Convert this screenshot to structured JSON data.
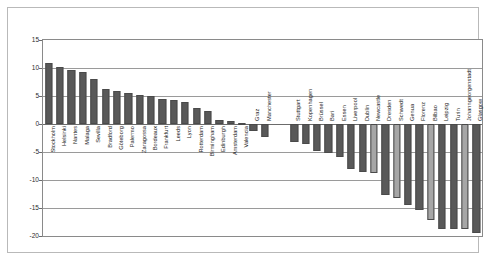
{
  "chart_data": {
    "type": "bar",
    "title": "",
    "subtitle": "",
    "xlabel": "",
    "ylabel": "",
    "ylim": [
      -20,
      15
    ],
    "yticks": [
      15,
      10,
      5,
      0,
      -5,
      -10,
      -15,
      -20
    ],
    "ytick_labels": [
      "15",
      "10",
      "5",
      "0",
      "-5",
      "-10",
      "-15",
      "-20"
    ],
    "grid": true,
    "legend": "none",
    "gap_after_index": 19,
    "colors": {
      "bar_dark": "#595959",
      "bar_light": "#a6a6a6",
      "bar_border": "#4a4a4a",
      "grid": "#9a9a9a",
      "zero_line": "#6b6b6b",
      "axis": "#8a8a8a",
      "frame": "#b9b9b9",
      "text": "#1a1a1a",
      "background": "#ffffff"
    },
    "categories": [
      "Stockholm",
      "Helsinki",
      "Nantes",
      "Malaga",
      "Sevilla",
      "Bradford",
      "Göteborg",
      "Palermo",
      "Zaragossa",
      "Bordeaux",
      "Frankfurt",
      "Leeds",
      "Lyon",
      "Rotterdam",
      "Birmingham",
      "Edinburgh",
      "Amsterdam",
      "Valencia",
      "Graz",
      "Manchester",
      "Stuttgart",
      "Kopenhagen",
      "Brüssel",
      "Bari",
      "Essen",
      "Liverpool",
      "Dublin",
      "Newcastle",
      "Dresden",
      "Schwedt",
      "Genua",
      "Florenz",
      "Bilbao",
      "Leipzig",
      "Turin",
      "Johanngeorgenstadt",
      "Glasgow"
    ],
    "values": [
      10.9,
      10.2,
      9.7,
      9.3,
      8.1,
      6.2,
      5.9,
      5.5,
      5.1,
      5.0,
      4.4,
      4.3,
      3.9,
      2.9,
      2.4,
      0.7,
      0.6,
      0.1,
      -1.3,
      -2.3,
      -3.2,
      -3.6,
      -4.9,
      -5.1,
      -5.9,
      -8.0,
      -8.5,
      -8.8,
      -12.7,
      -13.3,
      -14.5,
      -15.3,
      -17.2,
      -18.7,
      -18.7,
      -18.7,
      -19.4
    ],
    "bar_shades": [
      "dark",
      "dark",
      "dark",
      "dark",
      "dark",
      "dark",
      "dark",
      "dark",
      "dark",
      "dark",
      "dark",
      "dark",
      "dark",
      "dark",
      "dark",
      "dark",
      "dark",
      "dark",
      "dark",
      "dark",
      "dark",
      "dark",
      "dark",
      "dark",
      "dark",
      "dark",
      "dark",
      "light",
      "dark",
      "light",
      "dark",
      "dark",
      "light",
      "dark",
      "dark",
      "light",
      "dark"
    ]
  }
}
